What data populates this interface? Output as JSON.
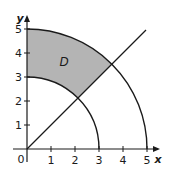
{
  "diagram": {
    "type": "polar region in first quadrant",
    "axes": {
      "x_label": "x",
      "y_label": "y",
      "origin_label": "0",
      "x_ticks": [
        "1",
        "2",
        "3",
        "4",
        "5"
      ],
      "y_ticks": [
        "1",
        "2",
        "3",
        "4",
        "5"
      ],
      "range": [
        0,
        5
      ]
    },
    "curves": [
      {
        "name": "inner-arc",
        "description": "quarter circle r = 3"
      },
      {
        "name": "outer-arc",
        "description": "quarter circle r = 5"
      },
      {
        "name": "diagonal-line",
        "description": "line y = x"
      }
    ],
    "region": {
      "label": "D",
      "description": "3 ≤ r ≤ 5, π/4 ≤ θ ≤ π/2",
      "fill_color": "#b4b4b4"
    },
    "colors": {
      "stroke": "#1a1a1a",
      "background": "#ffffff"
    }
  }
}
